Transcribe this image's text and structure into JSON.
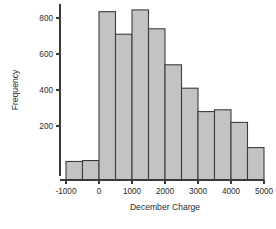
{
  "chart_data": {
    "type": "bar",
    "title": "",
    "xlabel": "December Charge",
    "ylabel": "Frequency",
    "bin_width": 500,
    "xlim": [
      -1000,
      5000
    ],
    "ylim": [
      0,
      880
    ],
    "grid": false,
    "legend": null,
    "xticks": [
      -1000,
      0,
      1000,
      2000,
      3000,
      4000,
      5000
    ],
    "xtick_labels": [
      "-1000",
      "0",
      "1000",
      "2000",
      "3000",
      "4000",
      "5000"
    ],
    "yticks": [
      200,
      400,
      600,
      800
    ],
    "ytick_labels": [
      "200",
      "400",
      "600",
      "800"
    ],
    "bin_edges": [
      -1000,
      -500,
      0,
      500,
      1000,
      1500,
      2000,
      2500,
      3000,
      3500,
      4000,
      4500,
      5000
    ],
    "values": [
      3,
      8,
      835,
      710,
      845,
      740,
      540,
      410,
      280,
      290,
      220,
      80
    ],
    "bar_fill": "#c3c3c3",
    "bar_stroke": "#3c3c3c",
    "axis_color": "#3a3a3a"
  }
}
